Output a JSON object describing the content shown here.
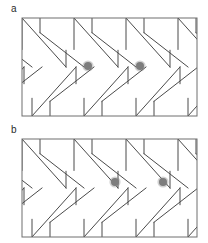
{
  "figure": {
    "caption_present": false,
    "background_color": "#ffffff",
    "width": 208,
    "height": 243,
    "panels": [
      {
        "id": "a",
        "label": "a",
        "label_position": {
          "x": 11,
          "y": 4
        },
        "frame": {
          "x": 22,
          "y": 18,
          "width": 175,
          "height": 98,
          "stroke_color": "#6e6e6e",
          "stroke_width": 1,
          "fill": "none"
        },
        "pattern": {
          "name": "sawtooth-zigzag-lattice",
          "rows": 2,
          "row_height": 49,
          "tooth_period": 52,
          "stroke_color": "#4a4a4a",
          "stroke_width": 1,
          "description": "Two mirrored rows of slanted parallelogram teeth forming a herringbone lattice"
        },
        "markers": [
          {
            "name": "marker-dot-1",
            "x": 88,
            "y": 66,
            "radius": 4,
            "color": "#7d7d7d"
          },
          {
            "name": "marker-dot-2",
            "x": 140,
            "y": 66,
            "radius": 4,
            "color": "#7d7d7d"
          }
        ]
      },
      {
        "id": "b",
        "label": "b",
        "label_position": {
          "x": 11,
          "y": 4
        },
        "frame": {
          "x": 22,
          "y": 18,
          "width": 175,
          "height": 98,
          "stroke_color": "#6e6e6e",
          "stroke_width": 1,
          "fill": "none"
        },
        "pattern": {
          "name": "sawtooth-zigzag-lattice",
          "rows": 2,
          "row_height": 49,
          "tooth_period": 52,
          "stroke_color": "#4a4a4a",
          "stroke_width": 1,
          "description": "Two mirrored rows of slanted parallelogram teeth forming a herringbone lattice"
        },
        "markers": [
          {
            "name": "marker-dot-1",
            "x": 115,
            "y": 61,
            "radius": 4,
            "color": "#7d7d7d"
          },
          {
            "name": "marker-dot-2",
            "x": 163,
            "y": 61,
            "radius": 4,
            "color": "#7d7d7d"
          }
        ]
      }
    ]
  }
}
